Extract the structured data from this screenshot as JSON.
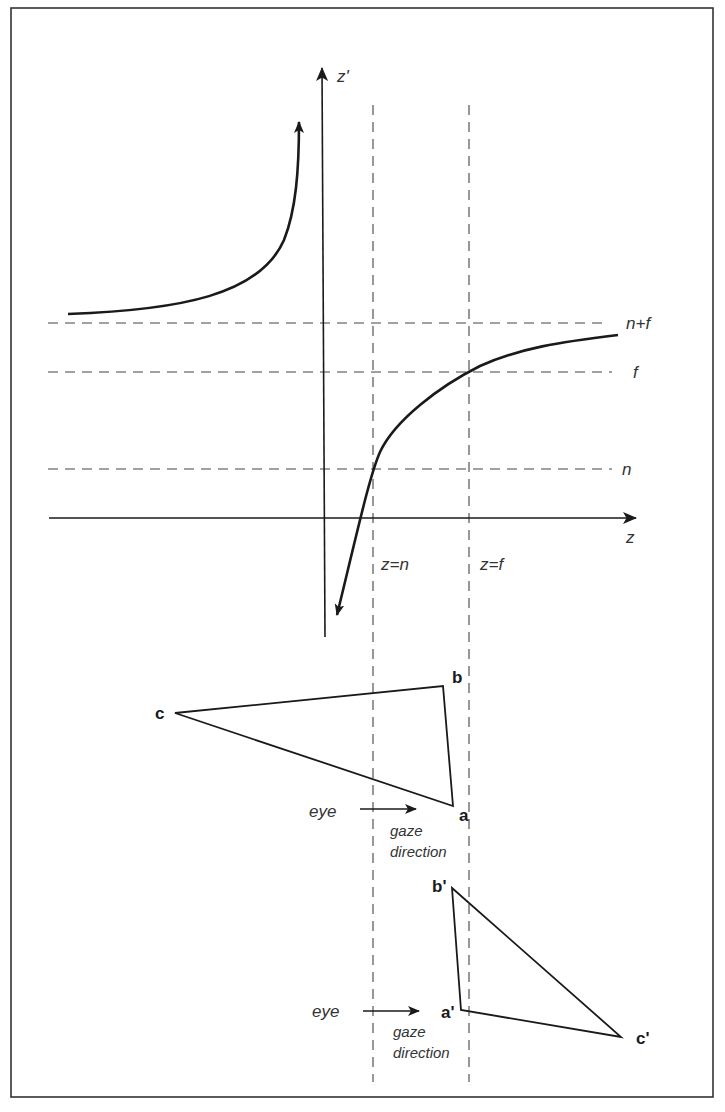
{
  "figure": {
    "axes": {
      "x_label": "z",
      "y_label": "z'"
    },
    "horizontal_guides": [
      {
        "label": "n+f"
      },
      {
        "label": "f"
      },
      {
        "label": "n"
      }
    ],
    "vertical_guides": [
      {
        "label": "z=n"
      },
      {
        "label": "z=f"
      }
    ],
    "triangle_original": {
      "vertices": {
        "a": "a",
        "b": "b",
        "c": "c"
      },
      "eye_label": "eye",
      "gaze_label_line1": "gaze",
      "gaze_label_line2": "direction"
    },
    "triangle_transformed": {
      "vertices": {
        "a": "a'",
        "b": "b'",
        "c": "c'"
      },
      "eye_label": "eye",
      "gaze_label_line1": "gaze",
      "gaze_label_line2": "direction"
    },
    "colors": {
      "ink": "#1a1a1a",
      "dash": "#444444",
      "background": "#ffffff"
    }
  }
}
